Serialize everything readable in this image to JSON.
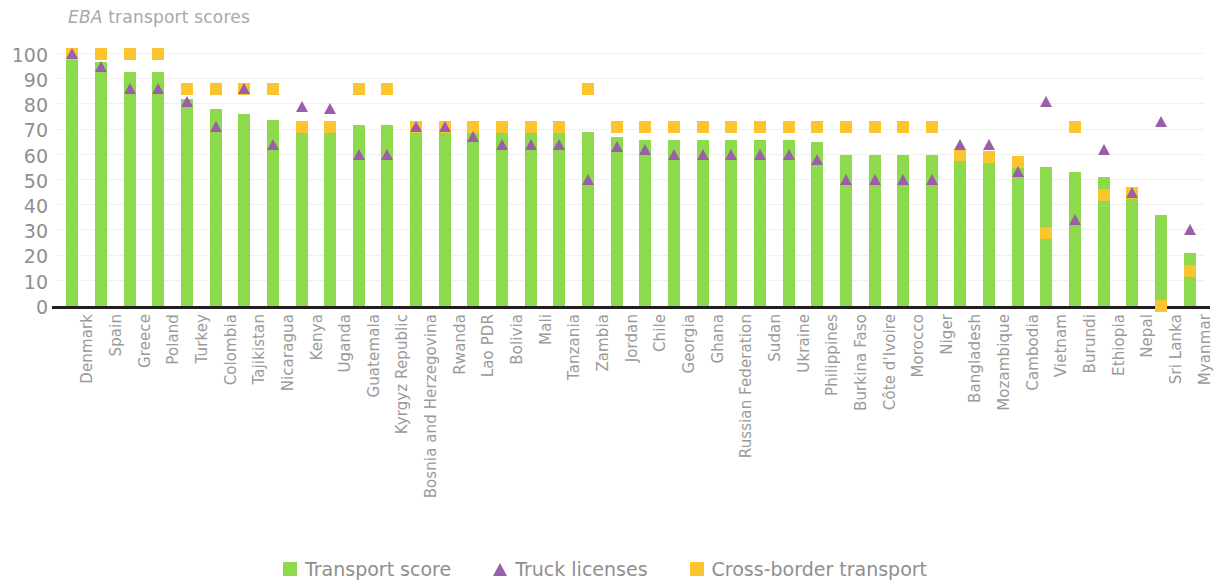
{
  "title": {
    "emphasis": "EBA",
    "rest": " transport scores"
  },
  "legend": [
    {
      "key": "transport_score",
      "label": "Transport score",
      "marker": "square",
      "color": "#8ddb4d"
    },
    {
      "key": "truck_licenses",
      "label": "Truck licenses",
      "marker": "triangle",
      "color": "#9a5fa8"
    },
    {
      "key": "cross_border_transport",
      "label": "Cross-border transport",
      "marker": "square",
      "color": "#fcc530"
    }
  ],
  "colors": {
    "transport_score": "#8ddb4d",
    "truck_licenses": "#9a5fa8",
    "cross_border_transport": "#fcc530",
    "axis": "#231f20",
    "text": "#8f8f8f",
    "grid": "#f0f0f0"
  },
  "chart_data": {
    "type": "bar",
    "title": "EBA transport scores",
    "xlabel": "",
    "ylabel": "",
    "ylim": [
      0,
      100
    ],
    "yticks": [
      0,
      10,
      20,
      30,
      40,
      50,
      60,
      70,
      80,
      90,
      100
    ],
    "grid": true,
    "legend_position": "bottom",
    "categories": [
      "Denmark",
      "Spain",
      "Greece",
      "Poland",
      "Turkey",
      "Colombia",
      "Tajikistan",
      "Nicaragua",
      "Kenya",
      "Uganda",
      "Guatemala",
      "Kyrgyz Republic",
      "Bosnia and Herzegovina",
      "Rwanda",
      "Lao PDR",
      "Bolivia",
      "Mali",
      "Tanzania",
      "Zambia",
      "Jordan",
      "Chile",
      "Georgia",
      "Ghana",
      "Russian Federation",
      "Sudan",
      "Ukraine",
      "Philippines",
      "Burkina Faso",
      "Côte d'Ivoire",
      "Morocco",
      "Niger",
      "Bangladesh",
      "Mozambique",
      "Cambodia",
      "Vietnam",
      "Burundi",
      "Ethiopia",
      "Nepal",
      "Sri Lanka",
      "Myanmar"
    ],
    "series": [
      {
        "name": "Transport score",
        "marker": "bar",
        "values": [
          100,
          97,
          93,
          93,
          82,
          78,
          76,
          74,
          72,
          72,
          72,
          72,
          71,
          71,
          70,
          70,
          70,
          70,
          69,
          67,
          66,
          66,
          66,
          66,
          66,
          66,
          65,
          60,
          60,
          60,
          60,
          60,
          59,
          57,
          55,
          53,
          51,
          45,
          36,
          21
        ]
      },
      {
        "name": "Truck licenses",
        "marker": "triangle",
        "values": [
          100,
          95,
          86,
          86,
          81,
          71,
          86,
          64,
          79,
          78,
          60,
          60,
          71,
          71,
          67,
          64,
          64,
          64,
          50,
          63,
          62,
          60,
          60,
          60,
          60,
          60,
          58,
          50,
          50,
          50,
          50,
          64,
          64,
          53,
          81,
          34,
          62,
          45,
          73,
          30
        ]
      },
      {
        "name": "Cross-border transport",
        "marker": "square",
        "values": [
          100,
          100,
          100,
          100,
          86,
          86,
          86,
          86,
          71,
          71,
          86,
          86,
          71,
          71,
          71,
          71,
          71,
          71,
          86,
          71,
          71,
          71,
          71,
          71,
          71,
          71,
          71,
          71,
          71,
          71,
          71,
          60,
          59,
          57,
          29,
          71,
          44,
          45,
          0,
          14
        ]
      }
    ]
  }
}
